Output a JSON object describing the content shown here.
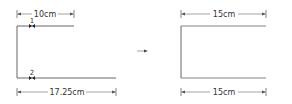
{
  "colors": {
    "line": "#555555",
    "dim": "#666666",
    "text": "#333333",
    "marker": "#222222"
  },
  "left_figure": {
    "top_dimension": "10cm",
    "bottom_dimension": "17.25cm",
    "markers": [
      {
        "label": "1"
      },
      {
        "label": "2"
      }
    ]
  },
  "arrow": {
    "icon": "right-arrow-icon"
  },
  "right_figure": {
    "top_dimension": "15cm",
    "bottom_dimension": "15cm"
  }
}
